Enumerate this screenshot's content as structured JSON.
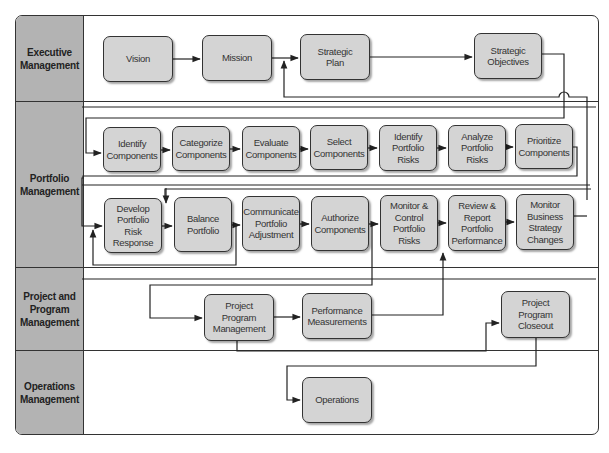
{
  "lanes": [
    {
      "id": "executive",
      "label": "Executive\nManagement",
      "top": 0,
      "height": 86
    },
    {
      "id": "portfolio",
      "label": "Portfolio\nManagement",
      "top": 86,
      "height": 166
    },
    {
      "id": "project",
      "label": "Project and\nProgram\nManagement",
      "top": 252,
      "height": 83
    },
    {
      "id": "operations",
      "label": "Operations\nManagement",
      "top": 335,
      "height": 83
    }
  ],
  "nodes": [
    {
      "id": "vision",
      "label": "Vision",
      "x": 103,
      "y": 36,
      "w": 70,
      "h": 46
    },
    {
      "id": "mission",
      "label": "Mission",
      "x": 202,
      "y": 35,
      "w": 70,
      "h": 46
    },
    {
      "id": "strategic_plan",
      "label": "Strategic\nPlan",
      "x": 300,
      "y": 34,
      "w": 70,
      "h": 46
    },
    {
      "id": "strategic_objectives",
      "label": "Strategic\nObjectives",
      "x": 474,
      "y": 33,
      "w": 68,
      "h": 46
    },
    {
      "id": "identify_components",
      "label": "Identify\nComponents",
      "x": 103,
      "y": 127,
      "w": 58,
      "h": 45
    },
    {
      "id": "categorize_components",
      "label": "Categorize\nComponents",
      "x": 172,
      "y": 126,
      "w": 58,
      "h": 45
    },
    {
      "id": "evaluate_components",
      "label": "Evaluate\nComponents",
      "x": 242,
      "y": 126,
      "w": 58,
      "h": 45
    },
    {
      "id": "select_components",
      "label": "Select\nComponents",
      "x": 310,
      "y": 125,
      "w": 58,
      "h": 45
    },
    {
      "id": "identify_portfolio_risks",
      "label": "Identify\nPortfolio\nRisks",
      "x": 379,
      "y": 125,
      "w": 58,
      "h": 46
    },
    {
      "id": "analyze_portfolio_risks",
      "label": "Analyze\nPortfolio\nRisks",
      "x": 448,
      "y": 125,
      "w": 58,
      "h": 46
    },
    {
      "id": "prioritize_components",
      "label": "Prioritize\nComponents",
      "x": 515,
      "y": 124,
      "w": 58,
      "h": 45
    },
    {
      "id": "develop_portfolio_risk_response",
      "label": "Develop\nPortfolio\nRisk\nResponse",
      "x": 104,
      "y": 198,
      "w": 58,
      "h": 55
    },
    {
      "id": "balance_portfolio",
      "label": "Balance\nPortfolio",
      "x": 174,
      "y": 197,
      "w": 58,
      "h": 55
    },
    {
      "id": "communicate_portfolio_adjustment",
      "label": "Communicate\nPortfolio\nAdjustment",
      "x": 242,
      "y": 196,
      "w": 58,
      "h": 55
    },
    {
      "id": "authorize_components",
      "label": "Authorize\nComponents",
      "x": 311,
      "y": 196,
      "w": 58,
      "h": 55
    },
    {
      "id": "monitor_control_portfolio_risks",
      "label": "Monitor &\nControl\nPortfolio\nRisks",
      "x": 380,
      "y": 195,
      "w": 58,
      "h": 56
    },
    {
      "id": "review_report_portfolio_performance",
      "label": "Review &\nReport\nPortfolio\nPerformance",
      "x": 448,
      "y": 195,
      "w": 58,
      "h": 56
    },
    {
      "id": "monitor_business_strategy_changes",
      "label": "Monitor\nBusiness\nStrategy\nChanges",
      "x": 516,
      "y": 194,
      "w": 58,
      "h": 56
    },
    {
      "id": "project_program_management",
      "label": "Project\nProgram\nManagement",
      "x": 204,
      "y": 294,
      "w": 70,
      "h": 47
    },
    {
      "id": "performance_measurements",
      "label": "Performance\nMeasurements",
      "x": 302,
      "y": 293,
      "w": 70,
      "h": 46
    },
    {
      "id": "project_program_closeout",
      "label": "Project\nProgram\nCloseout",
      "x": 501,
      "y": 291,
      "w": 69,
      "h": 47
    },
    {
      "id": "operations",
      "label": "Operations",
      "x": 302,
      "y": 377,
      "w": 70,
      "h": 46
    }
  ],
  "colors": {
    "lane_label_bg": "#b3b3b3",
    "node_fill": "#d4d4d4",
    "line": "#333333"
  }
}
